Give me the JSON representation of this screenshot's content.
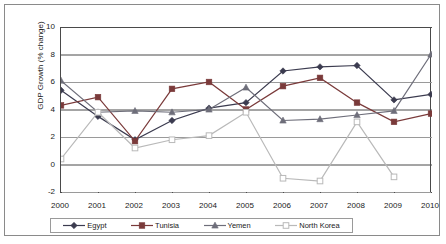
{
  "chart_data": {
    "type": "line",
    "title": "",
    "xlabel": "",
    "ylabel": "GDP Growth (% change)",
    "categories": [
      "2000",
      "2001",
      "2002",
      "2003",
      "2004",
      "2005",
      "2006",
      "2007",
      "2008",
      "2009",
      "2010"
    ],
    "ylim": [
      -2,
      10
    ],
    "yticks": [
      "10",
      "8",
      "6",
      "4",
      "2",
      "0",
      "-2"
    ],
    "ytick_values": [
      10,
      8,
      6,
      4,
      2,
      0,
      -2
    ],
    "grid": true,
    "legend_position": "bottom",
    "series": [
      {
        "name": "Egypt",
        "marker": "diamond",
        "color": "#3b3b4f",
        "values": [
          5.4,
          3.5,
          1.8,
          3.2,
          4.1,
          4.5,
          6.8,
          7.1,
          7.2,
          4.7,
          5.1
        ]
      },
      {
        "name": "Tunisia",
        "marker": "square",
        "color": "#7a3a3a",
        "values": [
          4.3,
          4.9,
          1.7,
          5.5,
          6.0,
          4.0,
          5.7,
          6.3,
          4.5,
          3.1,
          3.7
        ]
      },
      {
        "name": "Yemen",
        "marker": "triangle",
        "color": "#6e6e7a",
        "values": [
          6.1,
          3.8,
          3.9,
          3.8,
          4.0,
          5.6,
          3.2,
          3.3,
          3.6,
          3.9,
          8.0
        ]
      },
      {
        "name": "North Korea",
        "marker": "open-square",
        "color": "#b9b9b9",
        "values": [
          0.4,
          3.8,
          1.2,
          1.8,
          2.1,
          3.8,
          -1.0,
          -1.2,
          3.1,
          -0.9,
          null
        ]
      }
    ]
  },
  "legend": {
    "items": [
      {
        "label": "Egypt"
      },
      {
        "label": "Tunisia"
      },
      {
        "label": "Yemen"
      },
      {
        "label": "North Korea"
      }
    ]
  }
}
